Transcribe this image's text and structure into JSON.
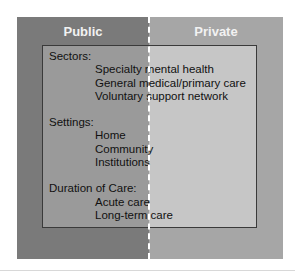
{
  "columns": {
    "left": "Public",
    "right": "Private"
  },
  "groups": [
    {
      "heading": "Sectors:",
      "items": [
        "Specialty mental health",
        "General medical/primary care",
        "Voluntary support network"
      ]
    },
    {
      "heading": "Settings:",
      "items": [
        "Home",
        "Community",
        "Institutions"
      ]
    },
    {
      "heading": "Duration of Care:",
      "items": [
        "Acute care",
        "Long-term care"
      ]
    }
  ],
  "colors": {
    "outer_public": "#7a7a7a",
    "outer_private": "#a6a6a6",
    "inner_public": "#9a9a9a",
    "inner_private": "#c6c6c6"
  }
}
